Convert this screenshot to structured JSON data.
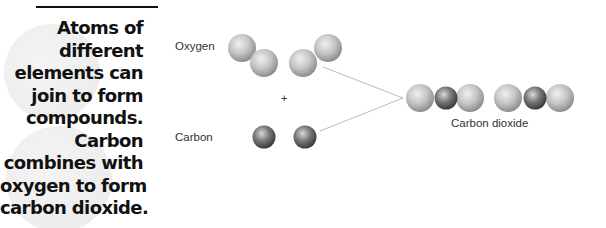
{
  "caption": {
    "lines": [
      "Atoms of",
      "different",
      "elements can",
      "join to form",
      "compounds.",
      "Carbon",
      "combines with",
      "oxygen to form",
      "carbon dioxide."
    ]
  },
  "diagram": {
    "oxygen_label": "Oxygen",
    "carbon_label": "Carbon",
    "plus_sign": "+",
    "product_label": "Carbon dioxide",
    "colors": {
      "oxygen_atom": "#bdbdbd",
      "carbon_atom": "#6e6e6e",
      "connector_line": "#bbbbbb"
    },
    "reactants": {
      "oxygen_molecules": 2,
      "carbon_atoms": 2
    },
    "products": {
      "carbon_dioxide_molecules": 2
    }
  }
}
